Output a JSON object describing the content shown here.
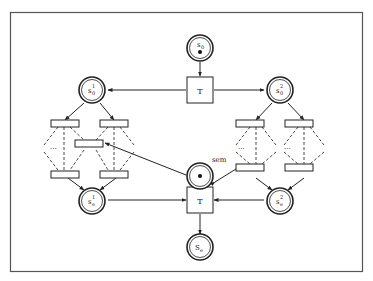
{
  "diagram": {
    "type": "petri-net",
    "places": [
      {
        "id": "s0",
        "label": "s",
        "sub": "0",
        "sup": "",
        "token": true
      },
      {
        "id": "s0_1",
        "label": "s",
        "sub": "0",
        "sup": "1",
        "token": false
      },
      {
        "id": "s0_2",
        "label": "s",
        "sub": "0",
        "sup": "2",
        "token": false
      },
      {
        "id": "sem",
        "label": "sem",
        "token": true
      },
      {
        "id": "se_1",
        "label": "s",
        "sub": "e",
        "sup": "1",
        "token": false
      },
      {
        "id": "se_2",
        "label": "s",
        "sub": "e",
        "sup": "2",
        "token": false
      },
      {
        "id": "se",
        "label": "S",
        "sub": "e",
        "sup": "",
        "token": false
      }
    ],
    "transitions": [
      {
        "id": "T_top",
        "label": "T"
      },
      {
        "id": "T_bottom",
        "label": "T"
      }
    ],
    "ellipsis": "..."
  }
}
